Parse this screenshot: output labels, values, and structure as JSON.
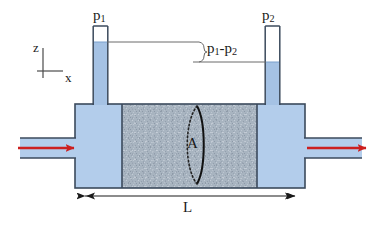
{
  "figure": {
    "labels": {
      "pressure_left": "p",
      "pressure_left_sub": "1",
      "pressure_right": "p",
      "pressure_right_sub": "2",
      "pressure_drop_a": "p",
      "pressure_drop_a_sub": "1",
      "pressure_drop_dash": "-",
      "pressure_drop_b": "p",
      "pressure_drop_b_sub": "2",
      "axis_z": "z",
      "axis_x": "x",
      "area": "A",
      "length": "L"
    },
    "colors": {
      "fluid": "#b3cdeb",
      "fluid_dark": "#a5c2e4",
      "porous": "#a8b4c0",
      "outline": "#3b4a5c",
      "arrow_red": "#cc1f1f",
      "leader_line": "#6a6a6a",
      "background": "#ffffff"
    },
    "geometry": {
      "body_left": 75,
      "body_right": 305,
      "body_top": 104,
      "body_bottom": 188,
      "porous_left": 122,
      "porous_right": 257,
      "tube_left_x": 93,
      "tube_right_x": 265,
      "tube_top": 26,
      "tube_width": 15,
      "level_left_y": 42,
      "level_right_y": 62,
      "inlet_y": 148,
      "length_arrow_y": 196
    },
    "annotations": {
      "flow_in": "inlet-flow-arrow",
      "flow_out": "outlet-flow-arrow",
      "cross_section": "cross-section-ellipse",
      "length_dimension": "length-dimension-arrow",
      "pressure_drop_bracket": "pressure-drop-bracket"
    }
  }
}
